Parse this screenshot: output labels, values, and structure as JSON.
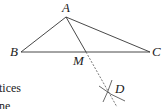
{
  "diagram": {
    "points": {
      "A": {
        "label": "A",
        "x": 66,
        "y": 17
      },
      "B": {
        "label": "B",
        "x": 21,
        "y": 52
      },
      "C": {
        "label": "C",
        "x": 150,
        "y": 52
      },
      "M": {
        "label": "M",
        "x": 86,
        "y": 52
      },
      "D": {
        "label": "D",
        "x": 109,
        "y": 91
      }
    },
    "segments": [
      "AB",
      "AC",
      "BC",
      "AM"
    ],
    "dashed": [
      "MD"
    ],
    "arcs_at": "D",
    "stroke_color": "#333333"
  },
  "text_fragments": {
    "line1": "tices",
    "line2": "ne"
  }
}
